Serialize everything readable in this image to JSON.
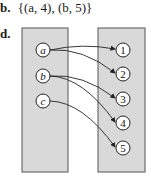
{
  "part_b": {
    "label": "b.",
    "expression": "{(a, 4), (b, 5)}"
  },
  "part_d": {
    "label": "d.",
    "domain_box": {
      "x": 22,
      "y": 28,
      "w": 46,
      "h": 144,
      "fill": "#d9d9d9",
      "stroke": "#555555"
    },
    "codomain_box": {
      "x": 98,
      "y": 28,
      "w": 47,
      "h": 144,
      "fill": "#d9d9d9",
      "stroke": "#555555"
    },
    "domain": [
      {
        "id": "a",
        "label": "a",
        "cx": 43,
        "cy": 50
      },
      {
        "id": "b",
        "label": "b",
        "cx": 43,
        "cy": 76
      },
      {
        "id": "c",
        "label": "c",
        "cx": 43,
        "cy": 101
      }
    ],
    "codomain": [
      {
        "id": "1",
        "label": "1",
        "cx": 123,
        "cy": 50
      },
      {
        "id": "2",
        "label": "2",
        "cx": 123,
        "cy": 74
      },
      {
        "id": "3",
        "label": "3",
        "cx": 123,
        "cy": 99
      },
      {
        "id": "4",
        "label": "4",
        "cx": 123,
        "cy": 123
      },
      {
        "id": "5",
        "label": "5",
        "cx": 123,
        "cy": 148
      }
    ],
    "arrows": [
      {
        "from": "a",
        "to": "1"
      },
      {
        "from": "a",
        "to": "2"
      },
      {
        "from": "b",
        "to": "3"
      },
      {
        "from": "b",
        "to": "4"
      },
      {
        "from": "c",
        "to": "5"
      }
    ]
  }
}
